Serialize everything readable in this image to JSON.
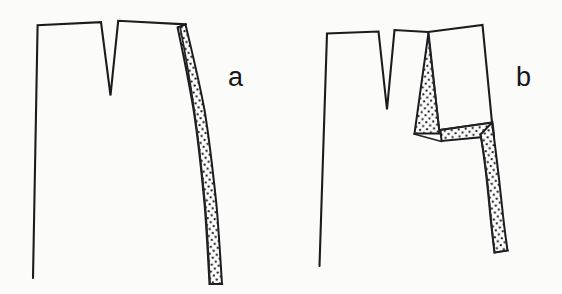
{
  "figure": {
    "background_color": "#fbfbfa",
    "ink_color": "#1c1c1e",
    "stipple_color": "#1c1c1e",
    "panels": [
      {
        "id": "panel-a",
        "label": "a",
        "label_x": 228,
        "label_y": 84,
        "description": "Outline with V-notch at top and a single continuous stippled band along the right edge running to the bottom",
        "outline_points": "38,24 38,29 33,278 33,272 36,93 37,47 38,29",
        "outline_path": "M 38,25 L 33,277",
        "top_edge_left": "38,25 L 100,22",
        "notch": "100,22 L 110,95 L 118,21",
        "top_edge_right": "118,21 L 186,24",
        "right_outer": "186,24 L 205,110 L 214,200 L 221,283",
        "right_inner": "186,26 L 196,108 L 203,200 L 209,283",
        "bottom_band": "209,283 L 221,283",
        "shaded_regions": [
          {
            "name": "right-band-a",
            "type": "stipple",
            "path": "M 186,24 L 205,110 L 214,200 L 222,284 L 209,284 L 202,200 L 195,110 L 185,27 Z"
          }
        ]
      },
      {
        "id": "panel-b",
        "label": "b",
        "label_x": 516,
        "label_y": 84,
        "description": "Same outline split apart: a narrow stippled wedge below the notch and a Z-shaped stippled band through the middle and lower right",
        "shaded_regions": [
          {
            "name": "upper-wedge-b",
            "type": "stipple",
            "path": "M 427,32 L 438,133 L 414,133 Z"
          },
          {
            "name": "middle-horizontal-band-b",
            "type": "stipple",
            "path": "M 440,131 L 492,124 L 492,136 L 441,141 Z"
          },
          {
            "name": "lower-band-b",
            "type": "stipple",
            "path": "M 492,124 L 507,250 L 494,252 L 480,136 Z"
          }
        ]
      }
    ],
    "labels": [
      {
        "name": "panel-label-a",
        "text": "a"
      },
      {
        "name": "panel-label-b",
        "text": "b"
      }
    ]
  }
}
